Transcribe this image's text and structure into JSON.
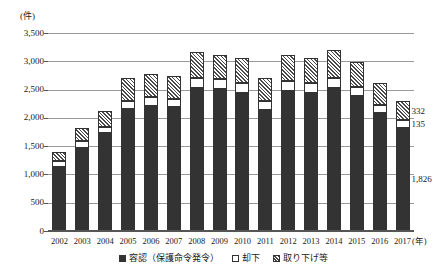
{
  "chart_data": {
    "type": "bar",
    "stacked": true,
    "title": "",
    "subtitle": "",
    "unit_label": "(件)",
    "xlabel": "(年)",
    "ylabel": "",
    "ylim": [
      0,
      3500
    ],
    "ytick_step": 500,
    "ytick_labels": [
      "3,500",
      "3,000",
      "2,500",
      "2,000",
      "1,500",
      "1,000",
      "500",
      "0"
    ],
    "grid": true,
    "legend_position": "bottom",
    "categories": [
      "2002",
      "2003",
      "2004",
      "2005",
      "2006",
      "2007",
      "2008",
      "2009",
      "2010",
      "2011",
      "2012",
      "2013",
      "2014",
      "2015",
      "2016",
      "2017"
    ],
    "series": [
      {
        "name": "容認（保護命令発令）",
        "key": "granted",
        "fill": "solid-dark",
        "color": "#333333",
        "values": [
          1128,
          1467,
          1728,
          2158,
          2216,
          2186,
          2525,
          2519,
          2434,
          2145,
          2472,
          2448,
          2528,
          2388,
          2082,
          1826
        ]
      },
      {
        "name": "却下",
        "key": "dismissed",
        "fill": "white",
        "color": "#ffffff",
        "values": [
          110,
          123,
          107,
          135,
          146,
          154,
          180,
          175,
          183,
          160,
          175,
          172,
          179,
          166,
          150,
          135
        ]
      },
      {
        "name": "取り下げ等",
        "key": "withdrawn",
        "fill": "hatched",
        "color": "#4a4a4a",
        "values": [
          157,
          230,
          287,
          418,
          422,
          408,
          452,
          424,
          441,
          397,
          473,
          430,
          487,
          432,
          388,
          332
        ]
      }
    ],
    "annotations": [
      {
        "text": "332",
        "series": "取り下げ等",
        "category": "2017",
        "value": 332
      },
      {
        "text": "135",
        "series": "却下",
        "category": "2017",
        "value": 135
      },
      {
        "text": "1,826",
        "series": "容認（保護命令発令）",
        "category": "2017",
        "value": 1826
      }
    ],
    "legend": [
      {
        "label": "容認（保護命令発令）",
        "swatch": "granted"
      },
      {
        "label": "却下",
        "swatch": "dismissed"
      },
      {
        "label": "取り下げ等",
        "swatch": "withdrawn"
      }
    ]
  }
}
